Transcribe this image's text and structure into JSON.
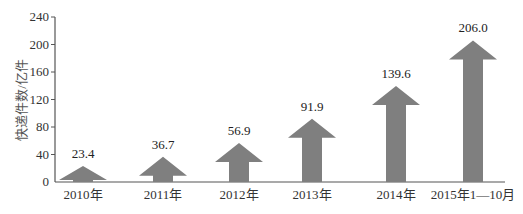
{
  "chart_data": {
    "type": "bar",
    "bar_shape": "arrow",
    "title": "",
    "xlabel": "",
    "ylabel": "快递件数/亿件",
    "ylim": [
      0,
      240
    ],
    "yticks": [
      0,
      40,
      80,
      120,
      160,
      200,
      240
    ],
    "grid": false,
    "legend": null,
    "categories": [
      "2010年",
      "2011年",
      "2012年",
      "2013年",
      "2014年",
      "2015年1—10月"
    ],
    "values": [
      23.4,
      36.7,
      56.9,
      91.9,
      139.6,
      206.0
    ],
    "value_labels": [
      "23.4",
      "36.7",
      "56.9",
      "91.9",
      "139.6",
      "206.0"
    ],
    "bar_color": "#7f7f7f"
  }
}
